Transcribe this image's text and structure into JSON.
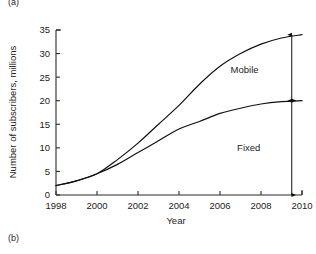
{
  "figure": {
    "panel_label_top": "(a)",
    "panel_label_bottom": "(b)"
  },
  "chart_data": {
    "type": "line",
    "title": "",
    "xlabel": "Year",
    "ylabel": "Number of subscribers, millions",
    "xlim": [
      1998,
      2010
    ],
    "ylim": [
      0,
      35
    ],
    "xticks": [
      1998,
      2000,
      2002,
      2004,
      2006,
      2008,
      2010
    ],
    "yticks": [
      0,
      5,
      10,
      15,
      20,
      25,
      30,
      35
    ],
    "xtick_labels": [
      "1998",
      "2000",
      "2002",
      "2004",
      "2006",
      "2008",
      "2010"
    ],
    "ytick_labels": [
      "0",
      "5",
      "10",
      "15",
      "20",
      "25",
      "30",
      "35"
    ],
    "grid": false,
    "legend_position": "inline-annotation",
    "x": [
      1998,
      1999,
      2000,
      2001,
      2002,
      2003,
      2004,
      2005,
      2006,
      2007,
      2008,
      2009,
      2010
    ],
    "series": [
      {
        "name": "Mobile",
        "values": [
          2.0,
          3.0,
          4.5,
          7.5,
          11.0,
          15.0,
          19.0,
          23.5,
          27.3,
          30.0,
          32.0,
          33.3,
          34.0
        ]
      },
      {
        "name": "Fixed",
        "values": [
          2.0,
          3.0,
          4.5,
          6.5,
          9.0,
          11.5,
          14.0,
          15.6,
          17.3,
          18.4,
          19.3,
          19.8,
          20.0
        ]
      }
    ],
    "annotations": [
      {
        "label": "Mobile",
        "kind": "double-arrow",
        "at_x": 2009.5,
        "from_y": 20.0,
        "to_y": 34.0,
        "label_x": 2007.2,
        "label_y": 26.5
      },
      {
        "label": "Fixed",
        "kind": "double-arrow",
        "at_x": 2009.5,
        "from_y": 0.0,
        "to_y": 20.0,
        "label_x": 2007.4,
        "label_y": 10.0
      }
    ],
    "colors": {
      "line": "#111111",
      "axis": "#2b2b2b",
      "text": "#232323",
      "background": "#ffffff"
    }
  }
}
